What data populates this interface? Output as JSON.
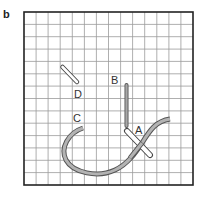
{
  "figure": {
    "panel_label": "b",
    "grid": {
      "columns": 14,
      "rows": 14,
      "line_color": "#999999",
      "border_color": "#222222"
    },
    "labels": {
      "A": "A",
      "B": "B",
      "C": "C",
      "D": "D"
    },
    "colors": {
      "thread_fill": "#b3b3b3",
      "thread_outline": "#555555",
      "needle_fill": "#ffffff",
      "needle_outline": "#444444"
    }
  }
}
